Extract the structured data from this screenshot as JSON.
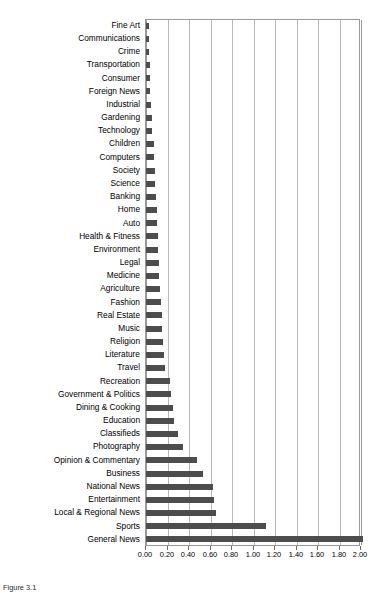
{
  "figure": {
    "caption": "Figure 3.1",
    "bar_color": "#4d4d4d",
    "grid_color": "#b9b9b9",
    "axis_color": "#9a9a9a"
  },
  "chart_data": {
    "type": "bar",
    "orientation": "horizontal",
    "title": "",
    "subtitle": "",
    "xlabel": "",
    "ylabel": "",
    "xlim": [
      0.0,
      2.0
    ],
    "grid": true,
    "legend": false,
    "xticks": [
      "0.00",
      "0.20",
      "0.40",
      "0.60",
      "0.80",
      "1.00",
      "1.20",
      "1.40",
      "1.60",
      "1.80",
      "2.00"
    ],
    "xtick_values": [
      0.0,
      0.2,
      0.4,
      0.6,
      0.8,
      1.0,
      1.2,
      1.4,
      1.6,
      1.8,
      2.0
    ],
    "categories": [
      "Fine Art",
      "Communications",
      "Crime",
      "Transportation",
      "Consumer",
      "Foreign News",
      "Industrial",
      "Gardening",
      "Technology",
      "Children",
      "Computers",
      "Society",
      "Science",
      "Banking",
      "Home",
      "Auto",
      "Health & Fitness",
      "Environment",
      "Legal",
      "Medicine",
      "Agriculture",
      "Fashion",
      "Real Estate",
      "Music",
      "Religion",
      "Literature",
      "Travel",
      "Recreation",
      "Government & Politics",
      "Dining & Cooking",
      "Education",
      "Classifieds",
      "Photography",
      "Opinion & Commentary",
      "Business",
      "National News",
      "Entertainment",
      "Local & Regional News",
      "Sports",
      "General News"
    ],
    "values": [
      0.03,
      0.03,
      0.03,
      0.04,
      0.04,
      0.04,
      0.05,
      0.06,
      0.06,
      0.07,
      0.07,
      0.08,
      0.08,
      0.09,
      0.1,
      0.1,
      0.11,
      0.11,
      0.12,
      0.12,
      0.13,
      0.14,
      0.15,
      0.15,
      0.16,
      0.17,
      0.18,
      0.22,
      0.23,
      0.25,
      0.26,
      0.3,
      0.34,
      0.47,
      0.53,
      0.62,
      0.63,
      0.65,
      1.12,
      2.02
    ]
  }
}
